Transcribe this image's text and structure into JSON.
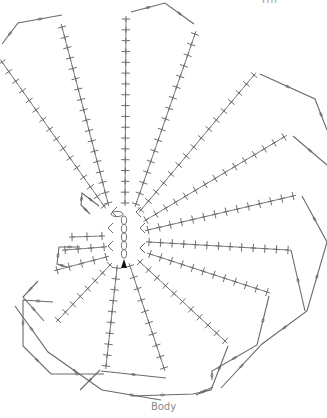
{
  "labels": {
    "top": "Hn",
    "bottom": "Body"
  },
  "colors": {
    "stroke": "#6e6e6e",
    "chain": "#6a6a6a",
    "marker": "#111111"
  },
  "center_chain": {
    "x": 124,
    "y_top": 216,
    "y_bottom": 258,
    "links": 5
  },
  "start_marker": {
    "x": 124,
    "y": 265
  },
  "rays": [
    {
      "x1": 2,
      "y1": 62,
      "x2": 104,
      "y2": 206,
      "stitches": 16
    },
    {
      "x1": 62,
      "y1": 27,
      "x2": 108,
      "y2": 203,
      "stitches": 18
    },
    {
      "x1": 126,
      "y1": 19,
      "x2": 125,
      "y2": 203,
      "stitches": 18
    },
    {
      "x1": 195,
      "y1": 34,
      "x2": 136,
      "y2": 204,
      "stitches": 17
    },
    {
      "x1": 254,
      "y1": 75,
      "x2": 141,
      "y2": 210,
      "stitches": 16
    },
    {
      "x1": 284,
      "y1": 137,
      "x2": 146,
      "y2": 220,
      "stitches": 15
    },
    {
      "x1": 293,
      "y1": 196,
      "x2": 148,
      "y2": 230,
      "stitches": 14
    },
    {
      "x1": 288,
      "y1": 250,
      "x2": 149,
      "y2": 242,
      "stitches": 13
    },
    {
      "x1": 267,
      "y1": 292,
      "x2": 150,
      "y2": 254,
      "stitches": 12
    },
    {
      "x1": 225,
      "y1": 341,
      "x2": 140,
      "y2": 262,
      "stitches": 11
    },
    {
      "x1": 164,
      "y1": 368,
      "x2": 130,
      "y2": 266,
      "stitches": 10
    },
    {
      "x1": 106,
      "y1": 366,
      "x2": 117,
      "y2": 268,
      "stitches": 10
    },
    {
      "x1": 58,
      "y1": 320,
      "x2": 110,
      "y2": 265,
      "stitches": 8
    },
    {
      "x1": 57,
      "y1": 270,
      "x2": 106,
      "y2": 257,
      "stitches": 5
    },
    {
      "x1": 65,
      "y1": 250,
      "x2": 104,
      "y2": 247,
      "stitches": 4
    },
    {
      "x1": 72,
      "y1": 237,
      "x2": 102,
      "y2": 236,
      "stitches": 3
    }
  ],
  "chains": [
    {
      "points": [
        [
          2,
          44
        ],
        [
          18,
          23
        ],
        [
          62,
          15
        ]
      ]
    },
    {
      "points": [
        [
          131,
          12
        ],
        [
          165,
          3
        ],
        [
          194,
          24
        ]
      ]
    },
    {
      "points": [
        [
          260,
          74
        ],
        [
          315,
          99
        ],
        [
          327,
          130
        ]
      ]
    },
    {
      "points": [
        [
          293,
          136
        ],
        [
          327,
          165
        ]
      ]
    },
    {
      "points": [
        [
          302,
          196
        ],
        [
          327,
          242
        ]
      ]
    },
    {
      "points": [
        [
          327,
          242
        ],
        [
          307,
          311
        ],
        [
          262,
          344
        ],
        [
          221,
          388
        ]
      ]
    },
    {
      "points": [
        [
          291,
          250
        ],
        [
          305,
          311
        ]
      ]
    },
    {
      "points": [
        [
          269,
          296
        ],
        [
          257,
          345
        ],
        [
          212,
          371
        ],
        [
          212,
          380
        ]
      ]
    },
    {
      "points": [
        [
          228,
          346
        ],
        [
          211,
          390
        ],
        [
          193,
          394
        ],
        [
          132,
          396
        ]
      ]
    },
    {
      "points": [
        [
          213,
          387
        ],
        [
          196,
          395
        ]
      ]
    },
    {
      "points": [
        [
          166,
          378
        ],
        [
          101,
          371
        ]
      ]
    },
    {
      "points": [
        [
          100,
          370
        ],
        [
          80,
          390
        ]
      ]
    },
    {
      "points": [
        [
          53,
          302
        ],
        [
          23,
          300
        ],
        [
          23,
          346
        ],
        [
          51,
          374
        ],
        [
          104,
          374
        ]
      ]
    },
    {
      "points": [
        [
          15,
          306
        ],
        [
          48,
          352
        ],
        [
          102,
          390
        ],
        [
          161,
          400
        ]
      ]
    },
    {
      "points": [
        [
          38,
          281
        ],
        [
          23,
          297
        ],
        [
          44,
          321
        ]
      ]
    },
    {
      "points": [
        [
          80,
          247
        ],
        [
          59,
          247
        ],
        [
          57,
          264
        ],
        [
          67,
          267
        ]
      ]
    },
    {
      "points": [
        [
          99,
          206
        ],
        [
          82,
          193
        ],
        [
          81,
          205
        ],
        [
          90,
          214
        ]
      ]
    }
  ]
}
